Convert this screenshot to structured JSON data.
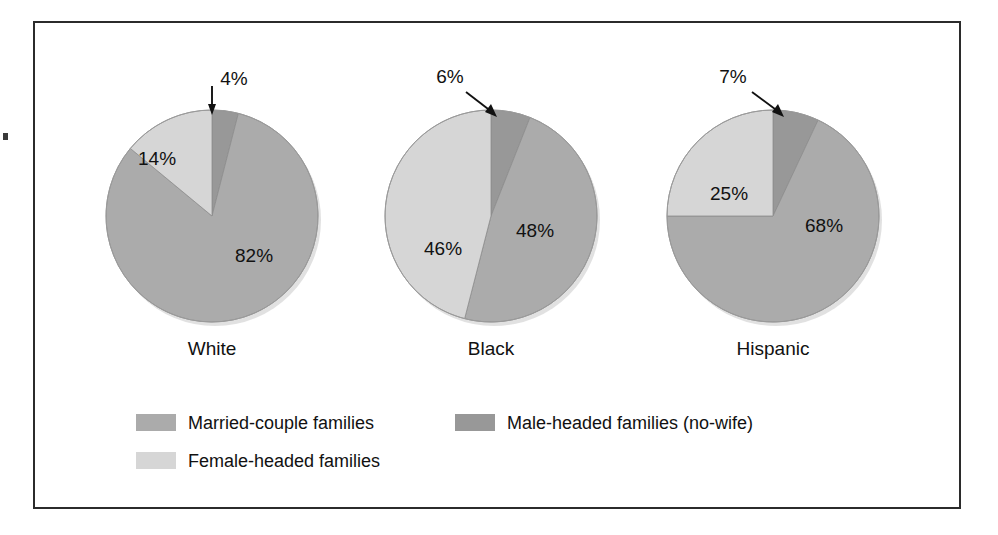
{
  "chart_data": {
    "type": "pie",
    "title": "",
    "subtitle": "",
    "xlabel": "",
    "ylabel": "",
    "legend_position": "bottom-left",
    "grid": false,
    "units": "percent",
    "categories": [
      "Married-couple families",
      "Male-headed families (no-wife)",
      "Female-headed families"
    ],
    "series": [
      {
        "name": "White",
        "values": [
          82,
          4,
          14
        ],
        "labels": [
          "82%",
          "4%",
          "14%"
        ]
      },
      {
        "name": "Black",
        "values": [
          48,
          6,
          46
        ],
        "labels": [
          "48%",
          "6%",
          "46%"
        ]
      },
      {
        "name": "Hispanic",
        "values": [
          68,
          7,
          25
        ],
        "labels": [
          "68%",
          "7%",
          "25%"
        ]
      }
    ],
    "colors": {
      "married": "#ababab",
      "male_headed": "#989898",
      "female_headed": "#d6d6d6",
      "outline": "#8d8d8d",
      "frame": "#2b2b2b",
      "text": "#111111"
    }
  },
  "pies": [
    {
      "key": "white",
      "label": "White",
      "cx": 212,
      "cy": 216,
      "r": 106,
      "label_x": 212,
      "label_y": 355,
      "slices": [
        {
          "name": "male-headed",
          "value": 4,
          "fill": "#989898",
          "start": 0,
          "end": 14.4
        },
        {
          "name": "married",
          "value": 82,
          "fill": "#ababab",
          "start": 14.4,
          "end": 309.6
        },
        {
          "name": "female-headed",
          "value": 14,
          "fill": "#d6d6d6",
          "start": 309.6,
          "end": 360
        }
      ],
      "value_labels": [
        {
          "name": "married-pct",
          "text": "82%",
          "x": 235,
          "y": 262
        },
        {
          "name": "female-headed-pct",
          "text": "14%",
          "x": 138,
          "y": 165
        }
      ],
      "callout": {
        "name": "male-headed-callout",
        "text": "4%",
        "text_x": 234,
        "text_y": 85,
        "line_x1": 212,
        "line_y1": 86,
        "line_x2": 212,
        "line_y2": 110,
        "head": "212,115 208,104 216,104"
      }
    },
    {
      "key": "black",
      "label": "Black",
      "cx": 491,
      "cy": 216,
      "r": 106,
      "label_x": 491,
      "label_y": 355,
      "slices": [
        {
          "name": "male-headed",
          "value": 6,
          "fill": "#989898",
          "start": 0,
          "end": 21.6
        },
        {
          "name": "married",
          "value": 48,
          "fill": "#ababab",
          "start": 21.6,
          "end": 194.4
        },
        {
          "name": "female-headed",
          "value": 46,
          "fill": "#d6d6d6",
          "start": 194.4,
          "end": 360
        }
      ],
      "value_labels": [
        {
          "name": "married-pct",
          "text": "48%",
          "x": 516,
          "y": 237
        },
        {
          "name": "female-headed-pct",
          "text": "46%",
          "x": 424,
          "y": 255
        }
      ],
      "callout": {
        "name": "male-headed-callout",
        "text": "6%",
        "text_x": 450,
        "text_y": 83,
        "line_x1": 466,
        "line_y1": 92,
        "line_x2": 492,
        "line_y2": 112,
        "head": "497,117 485,112 491,104"
      }
    },
    {
      "key": "hispanic",
      "label": "Hispanic",
      "cx": 773,
      "cy": 216,
      "r": 106,
      "label_x": 773,
      "label_y": 355,
      "slices": [
        {
          "name": "male-headed",
          "value": 7,
          "fill": "#989898",
          "start": 0,
          "end": 25.2
        },
        {
          "name": "married",
          "value": 68,
          "fill": "#ababab",
          "start": 25.2,
          "end": 270
        },
        {
          "name": "female-headed",
          "value": 25,
          "fill": "#d6d6d6",
          "start": 270,
          "end": 360
        }
      ],
      "value_labels": [
        {
          "name": "married-pct",
          "text": "68%",
          "x": 805,
          "y": 232
        },
        {
          "name": "female-headed-pct",
          "text": "25%",
          "x": 710,
          "y": 200
        }
      ],
      "callout": {
        "name": "male-headed-callout",
        "text": "7%",
        "text_x": 733,
        "text_y": 83,
        "line_x1": 752,
        "line_y1": 92,
        "line_x2": 779,
        "line_y2": 112,
        "head": "784,117 772,112 778,104"
      }
    }
  ],
  "legend": {
    "items": [
      {
        "key": "married",
        "label": "Married-couple families",
        "color": "#ababab",
        "swatch_x": 136,
        "swatch_y": 414,
        "text_x": 188,
        "text_y": 424
      },
      {
        "key": "male-headed",
        "label": "Male-headed families (no-wife)",
        "color": "#989898",
        "swatch_x": 455,
        "swatch_y": 414,
        "text_x": 507,
        "text_y": 424
      },
      {
        "key": "female-headed",
        "label": "Female-headed families",
        "color": "#d6d6d6",
        "swatch_x": 136,
        "swatch_y": 452,
        "text_x": 188,
        "text_y": 462
      }
    ],
    "swatch_width": 40,
    "swatch_height": 17
  }
}
